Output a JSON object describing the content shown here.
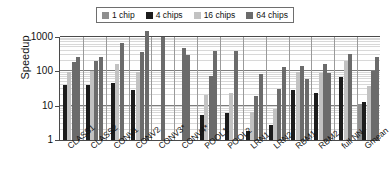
{
  "chart_data": {
    "type": "bar",
    "title": "",
    "subtitle": "",
    "xlabel": "",
    "ylabel": "Speedup",
    "yscale": "log",
    "ylim": [
      1,
      1000
    ],
    "yticks": [
      1,
      10,
      100,
      1000
    ],
    "ytick_labels": [
      "1",
      "10",
      "100",
      "1000"
    ],
    "grid": true,
    "grid_minor": true,
    "legend_position": "top-center",
    "categories": [
      "CLASS1",
      "CLASS2",
      "CONV1",
      "CONV2",
      "CONV3*",
      "CONV4*",
      "POOL1",
      "POOL2",
      "LRN1",
      "LRN2",
      "RBM1",
      "RBM2",
      "full NN",
      "Gmean"
    ],
    "series": [
      {
        "name": "1 chip",
        "color": "#8f8f8f",
        "values": [
          null,
          null,
          null,
          null,
          null,
          null,
          null,
          null,
          null,
          null,
          null,
          null,
          null,
          11
        ]
      },
      {
        "name": "4 chips",
        "color": "#1c1c1c",
        "values": [
          41,
          41,
          45,
          29,
          null,
          null,
          5.3,
          6.2,
          1.8,
          2.8,
          28,
          24,
          null,
          13
        ]
      },
      {
        "name": "16 chips",
        "color": "#c2c2c2",
        "values": [
          190,
          185,
          165,
          98,
          null,
          null,
          20,
          23,
          6.7,
          8.2,
          95,
          92,
          70,
          38
        ]
      },
      {
        "name": "64 chips",
        "color": "#6b6b6b",
        "values": [
          null,
          null,
          null,
          370,
          1000,
          480,
          74,
          null,
          19,
          31,
          143,
          92,
          200,
          105
        ]
      }
    ],
    "groups": [
      {
        "label": "CLASS1",
        "bars": [
          {
            "series": "4 chips",
            "value": 41
          },
          {
            "series": "16 chips",
            "value": 95
          },
          {
            "series": "64 chips",
            "value": 190
          },
          {
            "series": "64 chips",
            "value": 260
          }
        ]
      },
      {
        "label": "CLASS2",
        "bars": [
          {
            "series": "4 chips",
            "value": 41
          },
          {
            "series": "16 chips",
            "value": 100
          },
          {
            "series": "64 chips",
            "value": 195
          },
          {
            "series": "64 chips",
            "value": 260
          }
        ]
      },
      {
        "label": "CONV1",
        "bars": [
          {
            "series": "4 chips",
            "value": 45
          },
          {
            "series": "16 chips",
            "value": 165
          },
          {
            "series": "64 chips",
            "value": 680
          }
        ]
      },
      {
        "label": "CONV2",
        "bars": [
          {
            "series": "4 chips",
            "value": 29
          },
          {
            "series": "16 chips",
            "value": 98
          },
          {
            "series": "64 chips",
            "value": 370
          },
          {
            "series": "64 chips",
            "value": 1450
          }
        ]
      },
      {
        "label": "CONV3*",
        "bars": [
          {
            "series": "64 chips",
            "value": 1000
          }
        ]
      },
      {
        "label": "CONV4*",
        "bars": [
          {
            "series": "64 chips",
            "value": 480
          },
          {
            "series": "64 chips",
            "value": 300
          }
        ]
      },
      {
        "label": "POOL1",
        "bars": [
          {
            "series": "4 chips",
            "value": 5.3
          },
          {
            "series": "16 chips",
            "value": 20
          },
          {
            "series": "64 chips",
            "value": 74
          },
          {
            "series": "64 chips",
            "value": 400
          }
        ]
      },
      {
        "label": "POOL2",
        "bars": [
          {
            "series": "4 chips",
            "value": 6.2
          },
          {
            "series": "16 chips",
            "value": 23
          },
          {
            "series": "64 chips",
            "value": 400
          }
        ]
      },
      {
        "label": "LRN1",
        "bars": [
          {
            "series": "4 chips",
            "value": 1.8
          },
          {
            "series": "16 chips",
            "value": 6.7
          },
          {
            "series": "64 chips",
            "value": 19
          },
          {
            "series": "64 chips",
            "value": 85
          }
        ]
      },
      {
        "label": "LRN2",
        "bars": [
          {
            "series": "4 chips",
            "value": 2.8
          },
          {
            "series": "16 chips",
            "value": 8.2
          },
          {
            "series": "64 chips",
            "value": 31
          },
          {
            "series": "64 chips",
            "value": 130
          }
        ]
      },
      {
        "label": "RBM1",
        "bars": [
          {
            "series": "4 chips",
            "value": 28
          },
          {
            "series": "16 chips",
            "value": 95
          },
          {
            "series": "64 chips",
            "value": 143
          },
          {
            "series": "64 chips",
            "value": 60
          }
        ]
      },
      {
        "label": "RBM2",
        "bars": [
          {
            "series": "4 chips",
            "value": 24
          },
          {
            "series": "16 chips",
            "value": 92
          },
          {
            "series": "64 chips",
            "value": 160
          },
          {
            "series": "64 chips",
            "value": 90
          }
        ]
      },
      {
        "label": "full NN",
        "bars": [
          {
            "series": "4 chips",
            "value": 70
          },
          {
            "series": "16 chips",
            "value": 200
          },
          {
            "series": "64 chips",
            "value": 310
          }
        ]
      },
      {
        "label": "Gmean",
        "bars": [
          {
            "series": "1 chip",
            "value": 11
          },
          {
            "series": "4 chips",
            "value": 13
          },
          {
            "series": "16 chips",
            "value": 38
          },
          {
            "series": "64 chips",
            "value": 105
          },
          {
            "series": "64 chips",
            "value": 260
          }
        ]
      }
    ]
  },
  "legend": {
    "entries": [
      {
        "label": "1 chip",
        "color": "#8f8f8f"
      },
      {
        "label": "4 chips",
        "color": "#1c1c1c"
      },
      {
        "label": "16 chips",
        "color": "#c2c2c2"
      },
      {
        "label": "64 chips",
        "color": "#6b6b6b"
      }
    ]
  },
  "axes": {
    "y_title": "Speedup",
    "y_ticks": [
      "1000",
      "100",
      "10",
      "1"
    ],
    "x_ticks": [
      "CLASS1",
      "CLASS2",
      "CONV1",
      "CONV2",
      "CONV3*",
      "CONV4*",
      "POOL1",
      "POOL2",
      "LRN1",
      "LRN2",
      "RBM1",
      "RBM2",
      "full NN",
      "Gmean"
    ]
  },
  "colors": {
    "series_1_chip": "#8f8f8f",
    "series_4_chips": "#1c1c1c",
    "series_16_chips": "#c2c2c2",
    "series_64_chips": "#6b6b6b",
    "axis": "#4a4a4a",
    "grid_major": "#7d7d7d",
    "grid_minor": "#d8d8d8",
    "background": "#ffffff"
  }
}
